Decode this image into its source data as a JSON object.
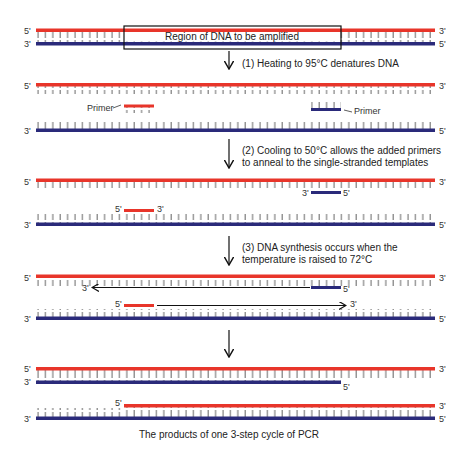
{
  "colors": {
    "template_strand": "#e8352a",
    "complement_strand": "#2a2a7a",
    "tick": "#555555",
    "arrow": "#111111"
  },
  "region_box": {
    "label": "Region of DNA to be amplified"
  },
  "steps": [
    {
      "id": 1,
      "text_lines": [
        "(1) Heating to 95°C denatures DNA"
      ]
    },
    {
      "id": 2,
      "text_lines": [
        "(2) Cooling to 50°C allows the added primers",
        "to anneal to the single-stranded templates"
      ]
    },
    {
      "id": 3,
      "text_lines": [
        "(3) DNA synthesis occurs when the",
        "temperature is raised to 72°C"
      ]
    }
  ],
  "primer_labels": {
    "left": "Primer",
    "right": "Primer"
  },
  "end_labels": {
    "five": "5'",
    "three": "3'"
  },
  "caption": "The products of one 3-step cycle of PCR"
}
